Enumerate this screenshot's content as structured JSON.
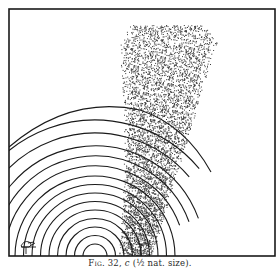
{
  "figure": {
    "caption": {
      "label": "Fig. 32,",
      "panel": "c",
      "scale": "(½ nat. size)."
    },
    "signature": "engraver-monogram",
    "colors": {
      "ink": "#1a1a1a",
      "paper": "#ffffff",
      "stipple": "#3a3a3a"
    },
    "frame": {
      "x": 9,
      "y": 9,
      "width": 266,
      "height": 247
    },
    "arcs": {
      "center_x": 95,
      "center_y": 256,
      "count": 14
    },
    "stipple_band": {
      "x_min": 118,
      "x_max": 222,
      "y_top": 25
    }
  }
}
